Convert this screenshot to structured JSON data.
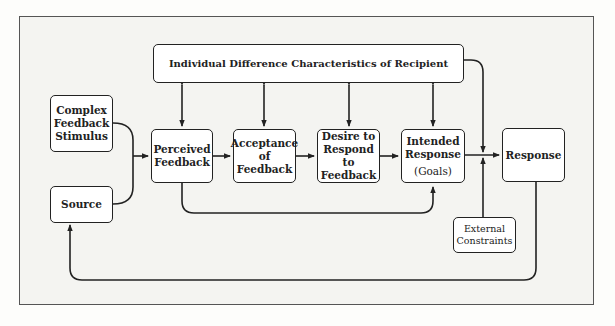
{
  "diagram": {
    "top_box": {
      "label": "Individual Difference Characteristics of Recipient"
    },
    "complex_feedback": {
      "lines": [
        "Complex",
        "Feedback",
        "Stimulus"
      ]
    },
    "source": {
      "label": "Source"
    },
    "perceived_feedback": {
      "lines": [
        "Perceived",
        "Feedback"
      ]
    },
    "acceptance": {
      "lines": [
        "Acceptance",
        "of",
        "Feedback"
      ]
    },
    "desire": {
      "lines": [
        "Desire to",
        "Respond to",
        "Feedback"
      ]
    },
    "intended_response": {
      "lines": [
        "Intended",
        "Response"
      ],
      "sub": "(Goals)"
    },
    "response": {
      "label": "Response"
    },
    "external_constraints": {
      "lines": [
        "External",
        "Constraints"
      ]
    }
  },
  "colors": {
    "line": "#222222",
    "frame_bg": "#f4f4f1",
    "box_bg": "#ffffff"
  }
}
